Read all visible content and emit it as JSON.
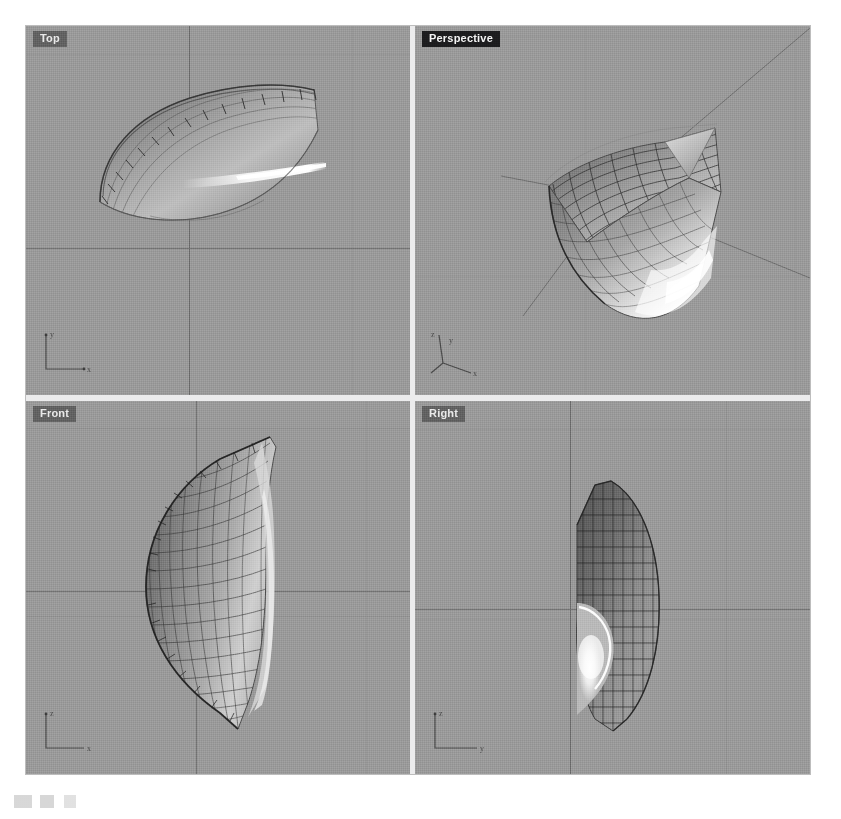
{
  "app": {
    "kind": "cad-modeler",
    "layout": "four-viewport",
    "background_color": "#9a9a9a",
    "divider_color": "#ececed",
    "axis_line_color": "#6f6f6f",
    "wire_color": "#3a3a3a",
    "highlight_color": "#ffffff",
    "active_label_bg": "#1d1d1f",
    "inactive_label_bg": "#525252",
    "label_text_color": "#eaeaea"
  },
  "viewports": [
    {
      "id": "top",
      "label": "Top",
      "active": false,
      "projection": "orthographic",
      "gizmo": {
        "axes": [
          "y",
          "x"
        ],
        "labels": {
          "vertical": "y",
          "horizontal": "x"
        }
      },
      "object": {
        "name": "nurbs-surface",
        "display_mode": "shaded-with-isocurves",
        "description": "flattened crescent sweep seen from above with bright specular streak"
      }
    },
    {
      "id": "perspective",
      "label": "Perspective",
      "active": true,
      "projection": "perspective",
      "gizmo": {
        "axes": [
          "z",
          "y",
          "x"
        ],
        "labels": {
          "vertical": "z",
          "right": "y",
          "front": "x"
        }
      },
      "object": {
        "name": "nurbs-surface",
        "display_mode": "shaded-with-isocurves",
        "description": "curved shell with dark wireframe top and bright specular lower edge"
      }
    },
    {
      "id": "front",
      "label": "Front",
      "active": false,
      "projection": "orthographic",
      "gizmo": {
        "axes": [
          "z",
          "x"
        ],
        "labels": {
          "vertical": "z",
          "horizontal": "x"
        }
      },
      "object": {
        "name": "nurbs-surface",
        "display_mode": "shaded-with-isocurves",
        "description": "leaf / teardrop profile with dense isocurve mesh on the left half"
      }
    },
    {
      "id": "right",
      "label": "Right",
      "active": false,
      "projection": "orthographic",
      "gizmo": {
        "axes": [
          "z",
          "y"
        ],
        "labels": {
          "vertical": "z",
          "horizontal": "y"
        }
      },
      "object": {
        "name": "nurbs-surface",
        "display_mode": "shaded-with-isocurves",
        "description": "rounded shell silhouette with concave notch and bright highlight"
      }
    }
  ]
}
